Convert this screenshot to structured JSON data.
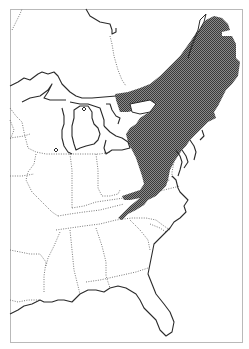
{
  "map": {
    "width": 249,
    "height": 349,
    "colors": {
      "background": "#ffffff",
      "frame": "#b9b9b9",
      "range_dark": "#3a3a3a",
      "range_light": "#8a8a8a",
      "coastline": "#2a2a2a",
      "state_border": "#6a6a6a"
    },
    "frame": {
      "x": 10,
      "y": 9,
      "w": 232,
      "h": 333
    },
    "region": "Eastern North America",
    "range_shape": [
      "M 115 94 L 128 92 L 140 88 L 150 84 L 160 76 L 170 66 L 180 56 L 190 42 L 198 30 L 206 20 L 214 16 L 222 18 L 228 24 L 230 30 L 222 32 L 222 36 L 232 36 L 236 44 L 236 58 L 240 62 L 238 76 L 232 84 L 226 90 L 222 98 L 218 106 L 214 112 L 216 118 L 208 122 L 202 128 L 196 134 L 190 140 L 186 146 L 182 150 L 178 156 L 174 162 L 170 170 L 168 180 L 166 186 L 160 192 L 156 196 L 148 200 L 144 205 L 136 210 L 128 214 L 122 220 L 118 218 L 124 212 L 130 206 L 140 198 L 130 200 L 124 200 L 122 196 L 134 192 L 140 190 L 144 184 L 142 176 L 140 170 L 138 164 L 136 158 L 132 150 L 128 142 L 126 134 L 130 128 L 136 124 L 140 118 L 146 114 L 150 112 L 150 106 L 144 108 L 136 110 L 128 112 L 120 112 L 118 106 L 116 100 Z"
    ],
    "range_gaps": [
      "M 200 20 L 206 14 L 204 22 L 196 36 L 190 52 L 188 58 L 192 44 L 198 30 Z",
      "M 130 104 L 140 102 L 150 100 L 156 104 L 150 112 L 140 114 L 132 112 Z"
    ],
    "coastlines": [
      "M 86 9 L 90 16 L 100 22 L 110 24 L 112 30 L 112 34 L 116 32 L 116 28",
      "M 10 86 L 18 82 L 24 78 L 30 80 L 38 74 L 42 72 L 48 74 L 54 72 L 58 76 L 62 84 L 66 88 L 70 92 L 76 96 L 82 98 L 92 98 L 104 97 L 116 96",
      "M 22 102 L 30 98 L 40 96 L 48 90 L 52 84 L 48 92 L 44 98 L 50 100 L 56 100 L 66 100",
      "M 70 102 L 80 104 L 88 104 L 94 106 L 100 108 L 102 114 L 104 120 L 104 126",
      "M 62 108 L 64 116 L 64 124 L 62 130 L 62 138 L 64 146 L 68 152 L 72 154",
      "M 74 110 L 80 106 L 88 106 L 92 112 L 92 118 L 94 124 L 98 128 L 100 134 L 98 140 L 94 144 L 86 146 L 80 148 L 76 150 L 74 144 L 72 136 L 72 126 L 74 118 Z",
      "M 104 126 L 110 132 L 116 136 L 122 138 L 128 142 L 130 148 L 122 150 L 112 150 L 106 154 L 104 148 L 106 140",
      "M 106 104 L 110 104 L 112 110 L 116 116 L 120 118 L 118 124",
      "M 172 176 L 176 180 L 178 188 L 180 192 L 184 196 L 188 200 L 184 206 L 186 212 L 180 218 L 174 222 L 170 228 L 166 232 L 160 238 L 154 244 L 152 254 L 150 264 L 148 274 L 152 284 L 156 294 L 164 304 L 170 312 L 174 322 L 172 332 L 166 336 L 160 330 L 156 320 L 150 314 L 144 308 L 140 300 L 136 294 L 126 288 L 118 286 L 110 288 L 104 292 L 96 290 L 88 290 L 80 294 L 72 302 L 64 300 L 58 300 L 52 302 L 44 302 L 40 300 L 32 304 L 24 306 L 18 310 L 10 314",
      "M 176 150 L 180 156 L 182 162 L 180 170 L 178 176",
      "M 182 150 L 186 156 L 188 162 L 184 168",
      "M 190 140 L 194 146 L 196 152 L 194 160",
      "M 202 130 L 204 136 L 200 140"
    ],
    "lakes": [
      "M 82 109 L 84 107 L 86 109 L 84 111 Z",
      "M 54 150 L 56 148 L 58 150 L 56 152 Z"
    ],
    "state_borders": [
      "M 12 30 L 16 22 L 20 14 L 22 9",
      "M 110 36 L 112 44 L 114 56 L 118 70 L 122 80 L 126 86",
      "M 10 108 L 16 116 L 22 122 L 24 132 L 26 140 L 28 148 L 36 152 L 46 154 L 60 154 L 72 154 L 86 154 L 100 154 L 110 152",
      "M 10 138 L 24 136 L 30 134",
      "M 10 176 L 22 176 L 34 174",
      "M 36 154 L 34 164 L 28 172 L 26 180 L 32 192 L 40 200 L 46 206 L 52 212 L 58 216",
      "M 70 154 L 72 170 L 72 190 L 72 208",
      "M 96 154 L 98 170 L 98 188 L 102 196 L 110 196 L 118 194 L 120 190",
      "M 72 208 L 84 206 L 96 202 L 110 200 L 124 198 L 140 196 L 156 192 L 180 186",
      "M 58 216 L 70 214 L 84 212 L 100 210 L 116 206 L 124 204",
      "M 56 230 L 70 228 L 84 226 L 100 224 L 116 220 L 132 218 L 146 218 L 156 220 L 164 226 L 170 230",
      "M 10 250 L 20 252 L 30 254 L 40 254 L 46 262 L 44 276 L 44 292",
      "M 60 232 L 54 246 L 48 258 L 46 266",
      "M 70 230 L 72 250 L 74 270 L 78 286 L 80 294",
      "M 96 228 L 102 246 L 106 262 L 106 276 L 110 288",
      "M 10 300 L 18 302 L 28 300 L 40 300",
      "M 86 282 L 100 280 L 118 276 L 136 272 L 148 268",
      "M 130 220 L 140 230 L 148 240 L 150 250",
      "M 150 224 L 160 228 L 166 232",
      "M 10 120 L 14 130 L 10 140",
      "M 160 132 L 166 138 L 172 144 L 176 150",
      "M 174 162 L 172 172 L 172 178",
      "M 128 142 L 140 146 L 156 150 L 172 148 L 182 150",
      "M 160 110 L 164 118 L 166 126 L 168 130",
      "M 150 186 L 160 182 L 170 180"
    ]
  }
}
